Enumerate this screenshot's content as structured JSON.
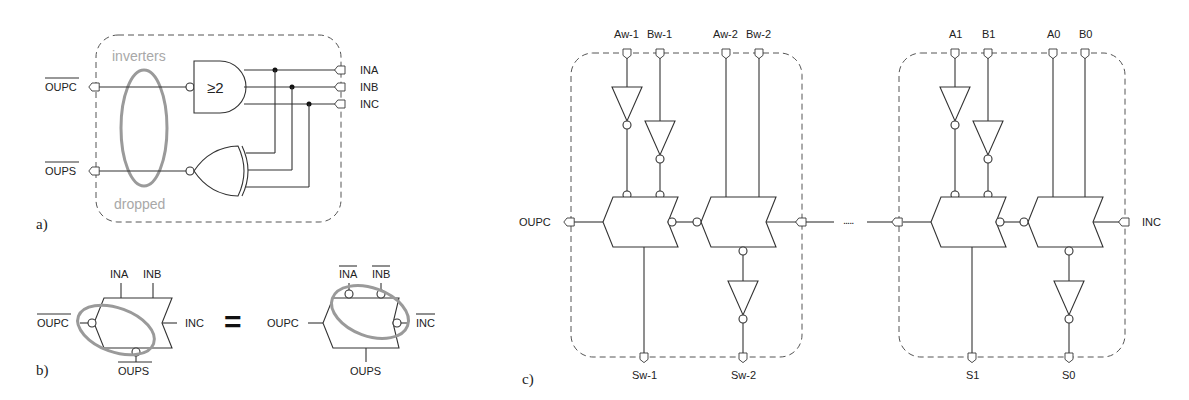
{
  "panels": {
    "a": {
      "label": "a)",
      "outputs": [
        "OUPC",
        "OUPS"
      ],
      "inputs": [
        "INA",
        "INB",
        "INC"
      ],
      "gate_majority_label": "≥2",
      "annotation_top": "inverters",
      "annotation_bottom": "dropped"
    },
    "b": {
      "label": "b)",
      "equals": "=",
      "left": {
        "top_inputs": [
          "INA",
          "INB"
        ],
        "left_out": "OUPC",
        "right_in": "INC",
        "bottom_out": "OUPS"
      },
      "right": {
        "top_inputs": [
          "INA",
          "INB"
        ],
        "left_out": "OUPC",
        "right_in": "INC",
        "bottom_out": "OUPS"
      }
    },
    "c": {
      "label": "c)",
      "left_out": "OUPC",
      "right_in": "INC",
      "ellipsis": ".....",
      "blocks": [
        {
          "inputs": [
            "Aw-1",
            "Bw-1",
            "Aw-2",
            "Bw-2"
          ],
          "outputs": [
            "Sw-1",
            "Sw-2"
          ]
        },
        {
          "inputs": [
            "A1",
            "B1",
            "A0",
            "B0"
          ],
          "outputs": [
            "S1",
            "S0"
          ]
        }
      ]
    }
  }
}
